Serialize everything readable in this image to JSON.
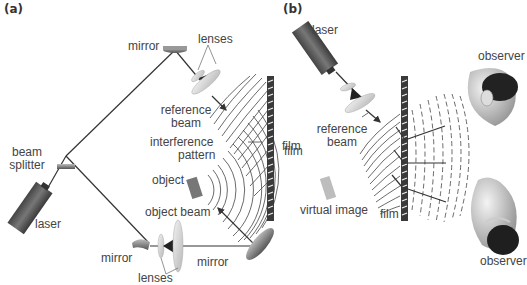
{
  "panels": {
    "a": {
      "tag": "(a)",
      "labels": {
        "mirror_top": "mirror",
        "lenses_top": "lenses",
        "reference_beam_1": "reference",
        "reference_beam_2": "beam",
        "interference_1": "interference",
        "interference_2": "pattern",
        "film": "film",
        "object": "object",
        "beam_splitter_1": "beam",
        "beam_splitter_2": "splitter",
        "laser": "laser",
        "object_beam": "object beam",
        "mirror_bottom_left": "mirror",
        "mirror_bottom_right": "mirror",
        "lenses_bottom": "lenses"
      }
    },
    "b": {
      "tag": "(b)",
      "labels": {
        "laser": "laser",
        "reference_beam_1": "reference",
        "reference_beam_2": "beam",
        "film_left": "film",
        "virtual_image": "virtual image",
        "film_bottom": "film",
        "observer_top": "observer",
        "observer_bottom": "observer"
      }
    }
  },
  "colors": {
    "beam": "#333333",
    "laser_body": "#5a5a5a",
    "film": "#3a3a3a",
    "lens": "#d4d4d4",
    "object": "#777777",
    "virtual_image": "#bdbdbd",
    "text": "#444444"
  }
}
